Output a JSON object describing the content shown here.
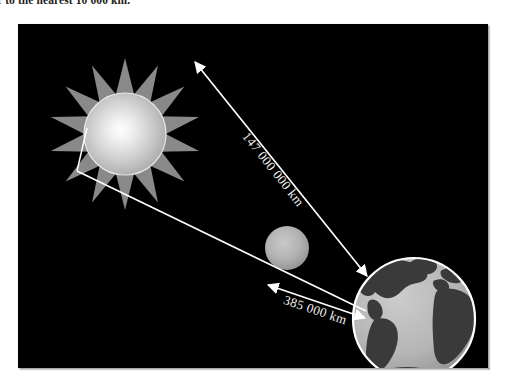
{
  "caption": {
    "text": "er to the nearest 10 000 km."
  },
  "figure": {
    "background_color": "#000000",
    "labels": {
      "sun_earth_distance": "147 000 000 km",
      "earth_moon_distance": "385 000 km"
    },
    "bodies": {
      "sun": {
        "name": "Sun",
        "core_color": "#ffffff",
        "mid_color": "#c9c9c9",
        "edge_color": "#9a9a9a",
        "ray_color": "#a8a8a8",
        "ray_count": 14,
        "center_x": 107,
        "center_y": 110,
        "radius": 41
      },
      "moon": {
        "name": "Moon",
        "fill_color": "#b4b4b4",
        "shade_color": "#8f8f8f",
        "center_x": 269,
        "center_y": 224,
        "radius": 22
      },
      "earth": {
        "name": "Earth",
        "ocean_color": "#b9b9b9",
        "land_color": "#3a3a3a",
        "outline_color": "#ffffff",
        "center_x": 396,
        "center_y": 295,
        "radius": 61
      }
    },
    "arrows": {
      "line_color": "#ffffff",
      "sun_earth": {
        "from_x": 177,
        "from_y": 38,
        "to_x": 349,
        "to_y": 252
      },
      "sun_earth_lower": {
        "from_x": 68,
        "from_y": 155,
        "to_x": 348,
        "to_y": 287
      },
      "earth_moon": {
        "from_x": 255,
        "from_y": 262,
        "to_x": 345,
        "to_y": 293
      }
    }
  }
}
